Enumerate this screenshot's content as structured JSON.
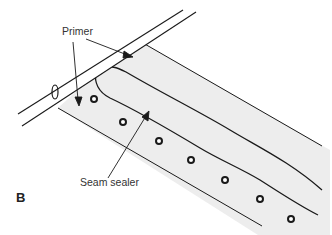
{
  "diagram": {
    "figure_label": "B",
    "labels": {
      "primer": "Primer",
      "seam_sealer": "Seam sealer"
    },
    "colors": {
      "line": "#1a1a1a",
      "panel_fill": "#ededed",
      "background": "#ffffff"
    },
    "components": [
      "tube",
      "panel",
      "seam-sealer-bead",
      "spot-welds"
    ]
  }
}
